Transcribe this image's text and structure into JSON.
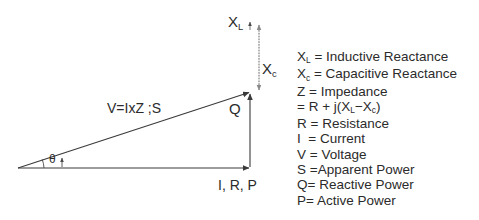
{
  "diagram": {
    "labels": {
      "inductive_reactance": "X",
      "inductive_reactance_sub": "L",
      "capacitive_reactance": "X",
      "capacitive_reactance_sub": "c",
      "reactive_power": "Q",
      "hypotenuse": "V=IxZ ;S",
      "angle": "θ",
      "horizontal_axis": "I, R, P"
    },
    "colors": {
      "stroke": "#3a3a3a",
      "dotted_stroke": "#8a8a8a",
      "text": "#2b2b2b",
      "background": "#ffffff"
    },
    "geometry": {
      "origin_x": 18,
      "origin_y": 168,
      "apex_x": 250,
      "apex_y": 92,
      "vertical_x": 250,
      "dotted_top_y": 22,
      "dotted_bottom_y": 90,
      "angle_deg": 18
    }
  },
  "legend": {
    "rows": [
      {
        "symbol": "X",
        "sub": "L",
        "text": " = Inductive Reactance"
      },
      {
        "symbol": "X",
        "sub": "c",
        "text": " = Capacitive Reactance"
      },
      {
        "symbol": "Z",
        "sub": "",
        "text": " = Impedance"
      },
      {
        "symbol": "",
        "sub": "",
        "text": "= R + j(X",
        "sub2": "L",
        "text2": "−X",
        "sub3": "c",
        "text3": ")"
      },
      {
        "symbol": "R",
        "sub": "",
        "text": " = Resistance"
      },
      {
        "symbol": "I",
        "sub": "",
        "text": "  = Current"
      },
      {
        "symbol": "V",
        "sub": "",
        "text": " = Voltage"
      },
      {
        "symbol": "S",
        "sub": "",
        "text": " =Apparent Power"
      },
      {
        "symbol": "Q",
        "sub": "",
        "text": "= Reactive Power"
      },
      {
        "symbol": "P",
        "sub": "",
        "text": "= Active Power"
      }
    ],
    "plain_lines": [
      "Xʟ = Inductive Reactance",
      "Xᴄ = Capacitive Reactance",
      "Z  = Impedance",
      "= R + j(Xʟ−Xᴄ)",
      "R = Resistance",
      "I  = Current",
      "V = Voltage",
      "S =Apparent Power",
      "Q= Reactive Power",
      "P= Active Power"
    ]
  }
}
